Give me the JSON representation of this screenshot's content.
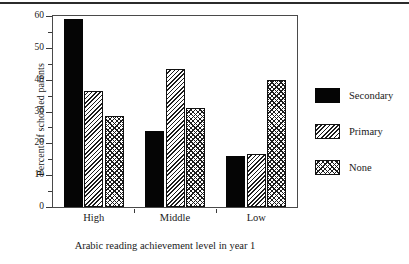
{
  "chart_data": {
    "type": "bar",
    "title": "",
    "subtitle": "",
    "xlabel": "Arabic reading achievement level in year 1",
    "ylabel": "Percent of schooled parents",
    "categories": [
      "High",
      "Middle",
      "Low"
    ],
    "series": [
      {
        "name": "Secondary",
        "values": [
          59,
          24,
          16
        ],
        "fill": "solid-black",
        "color": "#050505"
      },
      {
        "name": "Primary",
        "values": [
          36.5,
          43.5,
          16.7
        ],
        "fill": "diagonal-hatch",
        "color": "#1c1c1c"
      },
      {
        "name": "None",
        "values": [
          28.5,
          31,
          40
        ],
        "fill": "cross-hatch",
        "color": "#1c1c1c"
      }
    ],
    "ylim": [
      0,
      60
    ],
    "ymajor_ticks": [
      0,
      10,
      20,
      30,
      40,
      50,
      60
    ],
    "yminor_ticks": [
      5,
      15,
      25,
      35,
      45,
      55
    ],
    "ytick_labels": [
      "0",
      "10",
      "20",
      "30",
      "40",
      "50",
      "60"
    ],
    "grid": false,
    "legend_position": "right",
    "axis_color": "#4a4a4a",
    "text_color": "#1a1a1a",
    "background": "#ffffff"
  },
  "legend": {
    "entries": [
      {
        "label": "Secondary"
      },
      {
        "label": "Primary"
      },
      {
        "label": "None"
      }
    ]
  },
  "axes": {
    "y_title": "Percent of schooled parents",
    "x_title": "Arabic reading achievement level in year 1"
  }
}
